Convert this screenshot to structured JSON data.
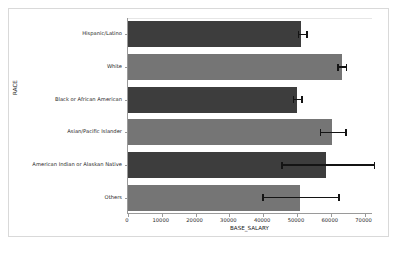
{
  "chart_data": {
    "type": "bar",
    "orientation": "horizontal",
    "title": "",
    "xlabel": "BASE_SALARY",
    "ylabel": "RACE",
    "categories": [
      "Hispanic/Latino",
      "White",
      "Black or African American",
      "Asian/Pacific Islander",
      "American Indian or Alaskan Native",
      "Others"
    ],
    "values": [
      51200,
      63400,
      50000,
      60300,
      58600,
      51000
    ],
    "errors_low": [
      50500,
      62200,
      49000,
      57000,
      45500,
      40000
    ],
    "errors_high": [
      53000,
      64600,
      51500,
      64500,
      73000,
      62500
    ],
    "xlim": [
      0,
      72500
    ],
    "xticks": [
      0,
      10000,
      20000,
      30000,
      40000,
      50000,
      60000,
      70000
    ],
    "xticklabels": [
      "0",
      "10000",
      "20000",
      "30000",
      "40000",
      "50000",
      "60000",
      "70000"
    ],
    "grid": false,
    "legend": "none",
    "colors": {
      "bar_dark": "#3d3d3d",
      "bar_light": "#757575",
      "error_bar": "#141414",
      "axis": "#9a9a9a",
      "text": "#262626",
      "background": "#ffffff"
    }
  }
}
